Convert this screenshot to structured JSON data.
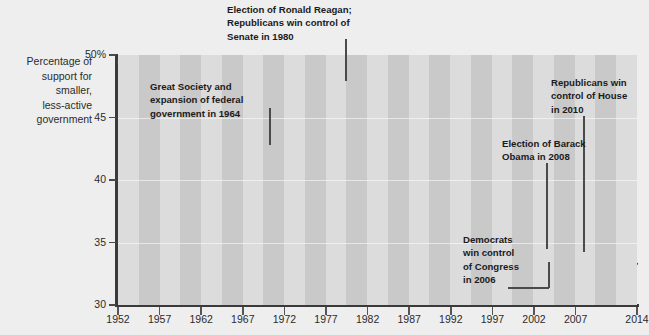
{
  "axis_title": {
    "lines": [
      "Percentage of",
      "support for",
      "smaller,",
      "less-active",
      "government"
    ]
  },
  "colors": {
    "page_background": "#eeeeee",
    "stripe_light": "#dcdcdc",
    "stripe_dark": "#c9c9c9",
    "line": "#4a4a4a",
    "axis": "#3a3a3a",
    "text": "#2b2b2b",
    "annotation_text": "#1b1b1b"
  },
  "annotations": [
    {
      "name": "annotation-great-society",
      "text": "Great Society and\nexpansion of federal\ngovernment in 1964",
      "x": 150,
      "y": 80,
      "leader": {
        "x": 269,
        "y": 108,
        "w": 1.6,
        "h": 37
      }
    },
    {
      "name": "annotation-reagan",
      "text": "Election of Ronald Reagan;\nRepublicans win control of\nSenate in 1980",
      "x": 227,
      "y": 3,
      "leader": {
        "x": 345,
        "y": 39,
        "w": 1.6,
        "h": 42
      }
    },
    {
      "name": "annotation-republicans-house-2010",
      "text": "Republicans win\ncontrol of House\nin 2010",
      "x": 551,
      "y": 76,
      "leader": {
        "x": 583,
        "y": 116,
        "w": 1.6,
        "h": 136
      }
    },
    {
      "name": "annotation-obama-2008",
      "text": "Election of Barack\nObama in 2008",
      "x": 502,
      "y": 137,
      "leader": {
        "x": 546,
        "y": 163,
        "w": 1.6,
        "h": 86
      }
    },
    {
      "name": "annotation-democrats-congress-2006",
      "text": "Democrats\nwin control\nof Congress\nin 2006",
      "x": 463,
      "y": 233,
      "leader_v": {
        "x": 548,
        "y": 262,
        "w": 1.6,
        "h": 26
      },
      "leader_h": {
        "x": 508,
        "y": 287,
        "w": 41,
        "h": 1.6
      }
    }
  ],
  "chart_data": {
    "type": "line",
    "title": "",
    "xlabel": "",
    "ylabel": "Percentage of support for smaller, less-active government",
    "ylim": [
      30,
      50
    ],
    "xlim": [
      1952,
      2014
    ],
    "grid": true,
    "legend": null,
    "ytick_labels": [
      "50%",
      "45",
      "40",
      "35",
      "30"
    ],
    "ytick_values": [
      50,
      45,
      40,
      35,
      30
    ],
    "xtick_labels": [
      "1952",
      "1957",
      "1962",
      "1967",
      "1972",
      "1977",
      "1982",
      "1987",
      "1992",
      "1997",
      "2002",
      "2007",
      "2014"
    ],
    "xtick_values": [
      1952,
      1957,
      1962,
      1967,
      1972,
      1977,
      1982,
      1987,
      1992,
      1997,
      2002,
      2007,
      2014
    ],
    "series": [
      {
        "name": "Support for smaller, less-active government",
        "x": [
          1952,
          1954,
          1956,
          1958,
          1960,
          1962,
          1964,
          1966,
          1968,
          1970,
          1972,
          1974,
          1976,
          1978,
          1980,
          1982,
          1984,
          1986,
          1988,
          1990,
          1992,
          1994,
          1996,
          1998,
          2000,
          2002,
          2004,
          2006,
          2008,
          2010,
          2012,
          2014
        ],
        "values": [
          49.5,
          45.8,
          41.8,
          38.1,
          39.6,
          31.4,
          31.6,
          34.4,
          33.6,
          33.8,
          45.6,
          42.4,
          38.2,
          38.2,
          36.0,
          39.1,
          41.0,
          42.4,
          43.2,
          45.0,
          49.9,
          46.8,
          47.0,
          42.8,
          42.3,
          40.2,
          37.2,
          34.6,
          35.2,
          34.0,
          33.3,
          33.3
        ]
      }
    ],
    "note": "Values estimated from plotted pixel positions; vertical axis 30-50%."
  },
  "series_pixel_path": "0,-6 17,39 34,85 52,129 70,110 87,230 104,227 122,192 139,204 156,200 173,51 191,90 208,144 225,146 242,174 260,136 277,113 294,94 312,84 329,63 346,0 363,37 381,34 398,88 415,94 432,120 449,157 467,192 484,183 501,198 518,207 519,207"
}
